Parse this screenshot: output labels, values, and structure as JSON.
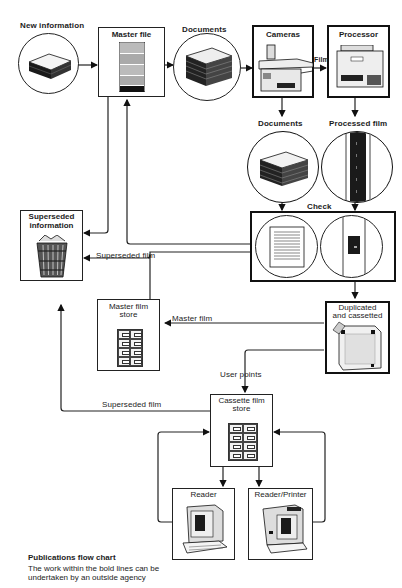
{
  "header": {
    "faded_text": ""
  },
  "nodes": {
    "new_information": {
      "label": "New information",
      "icon": "paper-stack-icon"
    },
    "master_file": {
      "label": "Master file",
      "icon": "filing-cabinet-icon"
    },
    "documents_top": {
      "label": "Documents",
      "icon": "document-stack-icon"
    },
    "cameras": {
      "label": "Cameras",
      "icon": "camera-machine-icon"
    },
    "processor": {
      "label": "Processor",
      "icon": "film-processor-icon"
    },
    "documents_check": {
      "label": "Documents",
      "icon": "document-stack-icon"
    },
    "processed_film": {
      "label": "Processed film",
      "icon": "film-strip-icon"
    },
    "check": {
      "label": "Check",
      "icon": "compare-icon"
    },
    "superseded_information": {
      "label_line1": "Superseded",
      "label_line2": "information",
      "icon": "waste-basket-icon"
    },
    "master_film_store": {
      "label_line1": "Master film",
      "label_line2": "store",
      "icon": "filing-drawers-icon"
    },
    "duplicated_cassetted": {
      "label_line1": "Duplicated",
      "label_line2": "and cassetted",
      "icon": "cassette-icon"
    },
    "cassette_film_store": {
      "label_line1": "Cassette film",
      "label_line2": "store",
      "icon": "filing-drawers-icon"
    },
    "reader": {
      "label": "Reader",
      "icon": "microfilm-reader-icon"
    },
    "reader_printer": {
      "label": "Reader/Printer",
      "icon": "microfilm-reader-printer-icon"
    }
  },
  "edges": {
    "film": "Film",
    "superseded_film_1": "Superseded film",
    "master_film": "Master film",
    "user_points": "User points",
    "superseded_film_2": "Superseded film"
  },
  "caption": {
    "title": "Publications flow chart",
    "body": "The work within the bold lines can be undertaken  by an outside agency"
  }
}
